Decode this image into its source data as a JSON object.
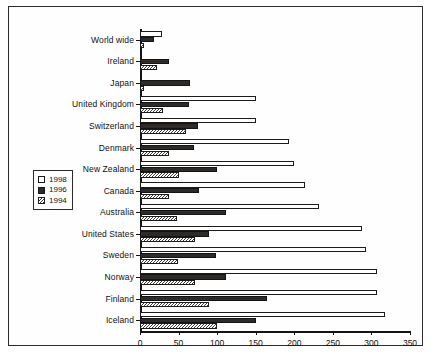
{
  "chart_data": {
    "type": "bar",
    "orientation": "horizontal",
    "title": "",
    "xlabel": "",
    "ylabel": "",
    "xlim": [
      0,
      350
    ],
    "xticks": [
      0,
      50,
      100,
      150,
      200,
      250,
      300,
      350
    ],
    "grid": false,
    "legend_position": "left-middle",
    "categories": [
      "World wide",
      "Ireland",
      "Japan",
      "United Kingdom",
      "Switzerland",
      "Denmark",
      "New Zealand",
      "Canada",
      "Australia",
      "United States",
      "Sweden",
      "Norway",
      "Finland",
      "Iceland"
    ],
    "series": [
      {
        "name": "1998",
        "color": "#ffffff",
        "pattern": "empty",
        "values": [
          28,
          0,
          0,
          150,
          150,
          193,
          200,
          214,
          232,
          288,
          293,
          307,
          307,
          317
        ]
      },
      {
        "name": "1996",
        "color": "#2d2a28",
        "pattern": "solid",
        "values": [
          18,
          38,
          65,
          63,
          75,
          70,
          100,
          77,
          112,
          90,
          99,
          112,
          165,
          150
        ]
      },
      {
        "name": "1994",
        "color": "#ffffff",
        "pattern": "hatched",
        "values": [
          5,
          22,
          5,
          30,
          60,
          37,
          50,
          37,
          48,
          71,
          49,
          71,
          89,
          100
        ]
      }
    ]
  },
  "legend": {
    "items": [
      {
        "label": "1998",
        "style": "y1998"
      },
      {
        "label": "1996",
        "style": "y1996"
      },
      {
        "label": "1994",
        "style": "y1994"
      }
    ]
  }
}
